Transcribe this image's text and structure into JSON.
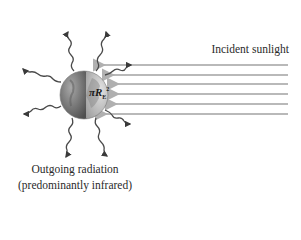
{
  "labels": {
    "incident": "Incident sunlight",
    "outgoing_line1": "Outgoing radiation",
    "outgoing_line2": "(predominantly infrared)",
    "globe_symbol": "πR",
    "globe_sub": "E",
    "globe_sup": "2"
  },
  "colors": {
    "sunlight_arrow": "#b9b9b9",
    "radiation_arrow": "#4a4a4a",
    "globe_dark": "#6e6e6e",
    "globe_light": "#c8c8c8"
  },
  "geometry": {
    "globe_center": [
      84,
      95
    ],
    "globe_radius": 24,
    "sunlight_rows_y": [
      65,
      75,
      84,
      94,
      104,
      114
    ]
  }
}
